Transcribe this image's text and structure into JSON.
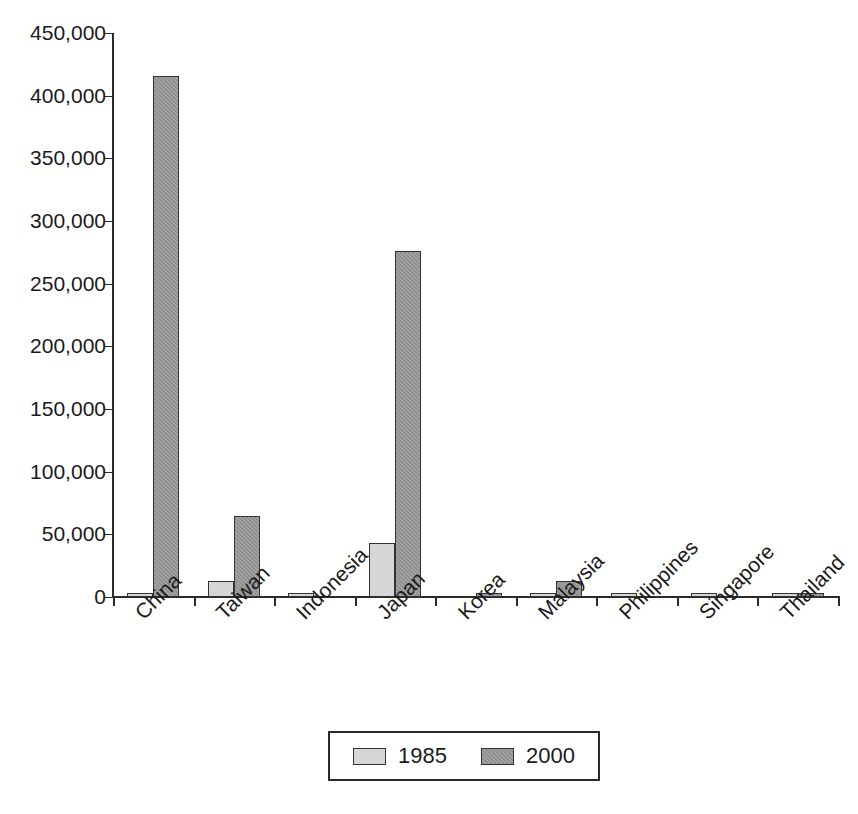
{
  "chart_data": {
    "type": "bar",
    "title": "",
    "subtitle": "",
    "xlabel": "",
    "ylabel": "",
    "categories": [
      "China",
      "Taiwan",
      "Indonesia",
      "Japan",
      "Korea",
      "Malaysia",
      "Philippines",
      "Singapore",
      "Thailand"
    ],
    "series": [
      {
        "name": "1985",
        "color": "#d6d6d6",
        "values": [
          3000,
          13000,
          3000,
          43000,
          0,
          2000,
          2000,
          2000,
          2500
        ]
      },
      {
        "name": "2000",
        "color": "#8f8f8f",
        "values": [
          416000,
          65000,
          0,
          276000,
          3000,
          13000,
          0,
          0,
          1500
        ]
      }
    ],
    "ylim": [
      0,
      450000
    ],
    "yticks": [
      0,
      50000,
      100000,
      150000,
      200000,
      250000,
      300000,
      350000,
      400000,
      450000
    ],
    "ytick_labels": [
      "0",
      "50,000",
      "100,000",
      "150,000",
      "200,000",
      "250,000",
      "300,000",
      "350,000",
      "400,000",
      "450,000"
    ],
    "grid": false,
    "legend_position": "bottom-center",
    "legend_entries": [
      "1985",
      "2000"
    ],
    "xtick_label_rotation": -45
  },
  "legend": {
    "entries": [
      {
        "label": "1985",
        "swatch": "legend-swatch-1985"
      },
      {
        "label": "2000",
        "swatch": "legend-swatch-2000"
      }
    ]
  }
}
